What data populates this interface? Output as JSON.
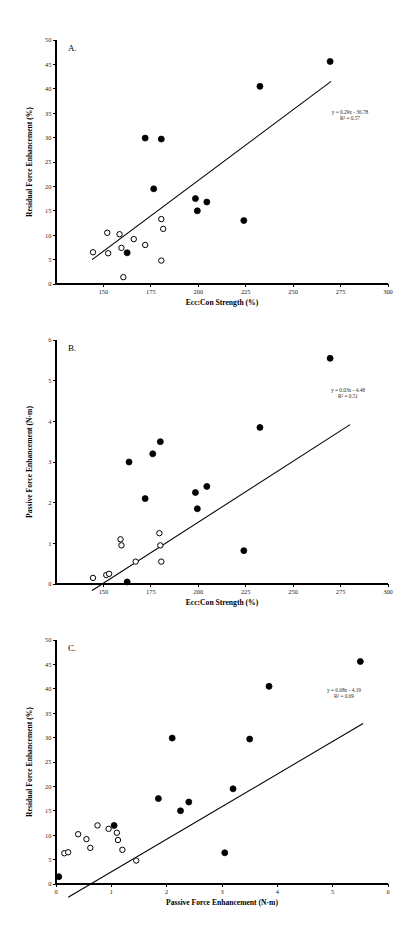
{
  "figure": {
    "panel_count": 3,
    "background_color": "#ffffff",
    "foreground_color": "#000000"
  },
  "chart_data": [
    {
      "type": "scatter",
      "panel_label": "A.",
      "title": "",
      "xlabel": "Ecc:Con Strength (%)",
      "ylabel": "Residual Force Enhancement (%)",
      "xlim": [
        125,
        300
      ],
      "ylim": [
        0,
        50
      ],
      "xticks": [
        150,
        175,
        200,
        225,
        250,
        275,
        300
      ],
      "yticks": [
        0,
        5,
        10,
        15,
        20,
        25,
        30,
        35,
        40,
        45,
        50
      ],
      "grid": false,
      "legend": "none",
      "annotation_equation": "y = 0.29x - 36.78",
      "annotation_r2": "R² = 0.57",
      "fit_slope": 0.29,
      "fit_intercept": -36.78,
      "r_squared": 0.57,
      "fit_x_range": [
        144,
        270
      ],
      "series": [
        {
          "name": "filled",
          "marker": "filled-circle",
          "points": [
            [
              162.5,
              6.4
            ],
            [
              172.0,
              29.9
            ],
            [
              176.5,
              19.5
            ],
            [
              180.5,
              29.7
            ],
            [
              198.5,
              17.5
            ],
            [
              199.5,
              15.0
            ],
            [
              204.5,
              16.8
            ],
            [
              224.0,
              13.0
            ],
            [
              232.5,
              40.5
            ],
            [
              269.5,
              45.6
            ]
          ]
        },
        {
          "name": "open",
          "marker": "open-circle",
          "points": [
            [
              144.5,
              6.5
            ],
            [
              152.0,
              10.5
            ],
            [
              152.5,
              6.3
            ],
            [
              158.5,
              10.2
            ],
            [
              159.5,
              7.4
            ],
            [
              160.5,
              1.4
            ],
            [
              166.0,
              9.2
            ],
            [
              172.0,
              8.0
            ],
            [
              180.5,
              13.3
            ],
            [
              180.5,
              4.8
            ],
            [
              181.5,
              11.3
            ]
          ]
        }
      ]
    },
    {
      "type": "scatter",
      "panel_label": "B.",
      "title": "",
      "xlabel": "Ecc:Con Strength (%)",
      "ylabel": "Passive Force Enhancement (N·m)",
      "xlim": [
        125,
        300
      ],
      "ylim": [
        0,
        6
      ],
      "xticks": [
        150,
        175,
        200,
        225,
        250,
        275,
        300
      ],
      "yticks": [
        0,
        1,
        2,
        3,
        4,
        5,
        6
      ],
      "grid": false,
      "legend": "none",
      "annotation_equation": "y = 0.03x - 4.48",
      "annotation_r2": "R² = 0.51",
      "fit_slope": 0.03,
      "fit_intercept": -4.48,
      "r_squared": 0.51,
      "fit_x_range": [
        144,
        280
      ],
      "series": [
        {
          "name": "filled",
          "marker": "filled-circle",
          "points": [
            [
              162.5,
              0.05
            ],
            [
              163.5,
              3.0
            ],
            [
              172.0,
              2.1
            ],
            [
              176.0,
              3.2
            ],
            [
              180.0,
              3.5
            ],
            [
              198.5,
              2.25
            ],
            [
              199.5,
              1.85
            ],
            [
              204.5,
              2.4
            ],
            [
              224.0,
              0.82
            ],
            [
              232.5,
              3.85
            ],
            [
              269.5,
              5.55
            ]
          ]
        },
        {
          "name": "open",
          "marker": "open-circle",
          "points": [
            [
              144.5,
              0.15
            ],
            [
              151.5,
              0.22
            ],
            [
              153.0,
              0.25
            ],
            [
              159.0,
              1.1
            ],
            [
              159.5,
              0.95
            ],
            [
              167.0,
              0.55
            ],
            [
              179.5,
              1.25
            ],
            [
              180.0,
              0.95
            ],
            [
              180.5,
              0.55
            ]
          ]
        }
      ]
    },
    {
      "type": "scatter",
      "panel_label": "C.",
      "title": "",
      "xlabel": "Passive Force Enhancement (N·m)",
      "ylabel": "Residual Force Enhancement (%)",
      "xlim": [
        0,
        6
      ],
      "ylim": [
        0,
        50
      ],
      "xticks": [
        0,
        1,
        2,
        3,
        4,
        5,
        6
      ],
      "yticks": [
        0,
        5,
        10,
        15,
        20,
        25,
        30,
        35,
        40,
        45,
        50
      ],
      "grid": false,
      "legend": "none",
      "annotation_equation": "y = 6.68x - 4.19",
      "annotation_r2": "R² = 0.69",
      "fit_slope": 6.68,
      "fit_intercept": -4.19,
      "r_squared": 0.69,
      "fit_x_range": [
        0.22,
        5.55
      ],
      "series": [
        {
          "name": "filled",
          "marker": "filled-circle",
          "points": [
            [
              0.05,
              1.5
            ],
            [
              1.05,
              12.0
            ],
            [
              1.85,
              17.5
            ],
            [
              2.1,
              29.9
            ],
            [
              2.25,
              15.0
            ],
            [
              2.4,
              16.8
            ],
            [
              3.05,
              6.4
            ],
            [
              3.2,
              19.5
            ],
            [
              3.5,
              29.7
            ],
            [
              3.85,
              40.5
            ],
            [
              5.5,
              45.6
            ]
          ]
        },
        {
          "name": "open",
          "marker": "open-circle",
          "points": [
            [
              0.15,
              6.3
            ],
            [
              0.22,
              6.5
            ],
            [
              0.4,
              10.2
            ],
            [
              0.55,
              9.2
            ],
            [
              0.62,
              7.4
            ],
            [
              0.75,
              12.0
            ],
            [
              0.95,
              11.3
            ],
            [
              1.1,
              10.5
            ],
            [
              1.12,
              9.0
            ],
            [
              1.2,
              7.0
            ],
            [
              1.45,
              4.8
            ]
          ]
        }
      ]
    }
  ]
}
